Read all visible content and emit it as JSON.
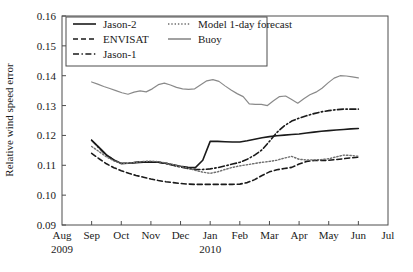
{
  "chart_data": {
    "type": "line",
    "title": "",
    "xlabel": "",
    "ylabel": "Relative wind speed error",
    "ylim": [
      0.09,
      0.16
    ],
    "ytick_labels": [
      "0.09",
      "0.10",
      "0.11",
      "0.12",
      "0.13",
      "0.14",
      "0.15",
      "0.16"
    ],
    "ytick_values": [
      0.09,
      0.1,
      0.11,
      0.12,
      0.13,
      0.14,
      0.15,
      0.16
    ],
    "xtick_labels": [
      "Aug",
      "Sep",
      "Oct",
      "Nov",
      "Dec",
      "Jan",
      "Feb",
      "Mar",
      "Apr",
      "May",
      "Jun",
      "Jul"
    ],
    "xtick_index": [
      0,
      1,
      2,
      3,
      4,
      5,
      6,
      7,
      8,
      9,
      10,
      11
    ],
    "year_labels": [
      {
        "text": "2009",
        "at_index": 0
      },
      {
        "text": "2010",
        "at_index": 5
      }
    ],
    "grid": false,
    "legend_position": "upper-left-inside",
    "x_data_start_index": 1,
    "x_data_end_index": 10,
    "samples_per_month": 4,
    "series": [
      {
        "name": "Jason-2",
        "style": "solid",
        "color": "#1a1a1a",
        "width": 1.6,
        "values": [
          0.1184,
          0.116,
          0.1135,
          0.1118,
          0.1106,
          0.1107,
          0.1109,
          0.111,
          0.1111,
          0.111,
          0.1107,
          0.1102,
          0.1097,
          0.1093,
          0.1092,
          0.1117,
          0.118,
          0.118,
          0.1179,
          0.1178,
          0.1178,
          0.1182,
          0.1187,
          0.1192,
          0.1196,
          0.1199,
          0.1201,
          0.1203,
          0.1205,
          0.1208,
          0.1211,
          0.1214,
          0.1216,
          0.1218,
          0.122,
          0.1222,
          0.1223
        ]
      },
      {
        "name": "ENVISAT",
        "style": "dashed",
        "color": "#1a1a1a",
        "width": 1.6,
        "values": [
          0.114,
          0.1122,
          0.1105,
          0.1092,
          0.1082,
          0.1073,
          0.1066,
          0.106,
          0.1054,
          0.1049,
          0.1045,
          0.1042,
          0.1039,
          0.1037,
          0.1036,
          0.1036,
          0.1036,
          0.1036,
          0.1036,
          0.1036,
          0.1037,
          0.1042,
          0.1052,
          0.1066,
          0.1078,
          0.1085,
          0.1089,
          0.1093,
          0.1104,
          0.1113,
          0.1116,
          0.1116,
          0.1117,
          0.1119,
          0.1122,
          0.1125,
          0.1127
        ]
      },
      {
        "name": "Jason-1",
        "style": "dashdot",
        "color": "#1a1a1a",
        "width": 1.6,
        "values": [
          0.1184,
          0.1158,
          0.1134,
          0.1117,
          0.1106,
          0.1107,
          0.111,
          0.1112,
          0.1112,
          0.111,
          0.1106,
          0.11,
          0.1094,
          0.1089,
          0.1086,
          0.1086,
          0.1088,
          0.1092,
          0.1098,
          0.1104,
          0.111,
          0.112,
          0.1134,
          0.1152,
          0.118,
          0.121,
          0.1232,
          0.1248,
          0.1258,
          0.1266,
          0.1273,
          0.1279,
          0.1283,
          0.1286,
          0.1288,
          0.1288,
          0.1288
        ]
      },
      {
        "name": "Model 1-day forecast",
        "style": "dotted",
        "color": "#6e6e6e",
        "width": 1.4,
        "values": [
          0.1163,
          0.1146,
          0.1128,
          0.1115,
          0.1107,
          0.1107,
          0.111,
          0.1113,
          0.1114,
          0.1112,
          0.1108,
          0.1102,
          0.1096,
          0.109,
          0.1083,
          0.1077,
          0.1073,
          0.1078,
          0.1086,
          0.1093,
          0.1098,
          0.1102,
          0.1106,
          0.111,
          0.1113,
          0.1117,
          0.1124,
          0.113,
          0.112,
          0.1118,
          0.1118,
          0.1119,
          0.1122,
          0.1128,
          0.1134,
          0.1133,
          0.113
        ]
      },
      {
        "name": "Buoy",
        "style": "solid",
        "color": "#8a8a8a",
        "width": 1.2,
        "values": [
          0.1379,
          0.1372,
          0.1364,
          0.1357,
          0.135,
          0.1343,
          0.1338,
          0.1345,
          0.1349,
          0.1346,
          0.1356,
          0.137,
          0.1375,
          0.1369,
          0.1361,
          0.1356,
          0.1354,
          0.1356,
          0.137,
          0.1383,
          0.1387,
          0.1381,
          0.1366,
          0.1352,
          0.134,
          0.133,
          0.1306,
          0.1304,
          0.1304,
          0.13,
          0.1316,
          0.133,
          0.1332,
          0.132,
          0.1308,
          0.1323,
          0.1336,
          0.1345,
          0.1358,
          0.1376,
          0.1392,
          0.14,
          0.1399,
          0.1396,
          0.1393
        ]
      }
    ],
    "legend_entries": [
      {
        "label": "Jason-2",
        "style": "solid",
        "color": "#1a1a1a"
      },
      {
        "label": "Model 1-day forecast",
        "style": "dotted",
        "color": "#6e6e6e"
      },
      {
        "label": "ENVISAT",
        "style": "dashed",
        "color": "#1a1a1a"
      },
      {
        "label": "Buoy",
        "style": "solid",
        "color": "#8a8a8a"
      },
      {
        "label": "Jason-1",
        "style": "dashdot",
        "color": "#1a1a1a"
      }
    ]
  }
}
